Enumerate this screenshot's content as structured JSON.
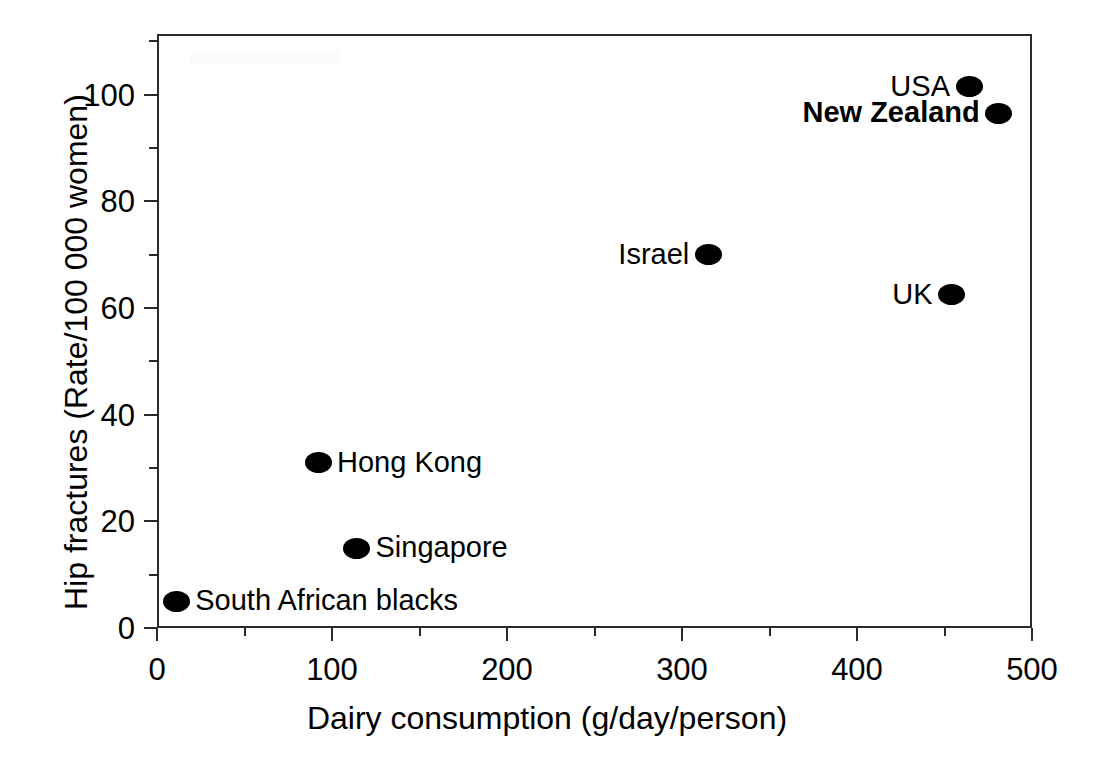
{
  "chart_data": {
    "type": "scatter",
    "title": "",
    "xlabel": "Dairy consumption (g/day/person)",
    "ylabel": "Hip fractures (Rate/100 000 women)",
    "xlim": [
      0,
      500
    ],
    "ylim": [
      0,
      111.4
    ],
    "grid": false,
    "legend": null,
    "x_major_ticks": [
      0,
      100,
      200,
      300,
      400,
      500
    ],
    "x_minor_ticks": [
      50,
      150,
      250,
      350,
      450
    ],
    "x_ticklabels": [
      "0",
      "100",
      "200",
      "300",
      "400",
      "500"
    ],
    "y_major_ticks": [
      0,
      20,
      40,
      60,
      80,
      100
    ],
    "y_minor_ticks": [
      10,
      30,
      50,
      70,
      90,
      110
    ],
    "y_ticklabels": [
      "0",
      "20",
      "40",
      "60",
      "80",
      "100"
    ],
    "marker_color": "#000000",
    "marker_shape": "filled-ellipse",
    "points": [
      {
        "label": "South African blacks",
        "x": 11,
        "y": 5,
        "label_side": "right",
        "bold": false
      },
      {
        "label": "Singapore",
        "x": 114,
        "y": 15,
        "label_side": "right",
        "bold": false
      },
      {
        "label": "Hong Kong",
        "x": 92,
        "y": 31,
        "label_side": "right",
        "bold": false
      },
      {
        "label": "Israel",
        "x": 315,
        "y": 70,
        "label_side": "left",
        "bold": false
      },
      {
        "label": "UK",
        "x": 454,
        "y": 62.5,
        "label_side": "left",
        "bold": false
      },
      {
        "label": "USA",
        "x": 464,
        "y": 101.5,
        "label_side": "left",
        "bold": false
      },
      {
        "label": "New Zealand",
        "x": 481,
        "y": 96.5,
        "label_side": "left",
        "bold": true
      }
    ]
  }
}
